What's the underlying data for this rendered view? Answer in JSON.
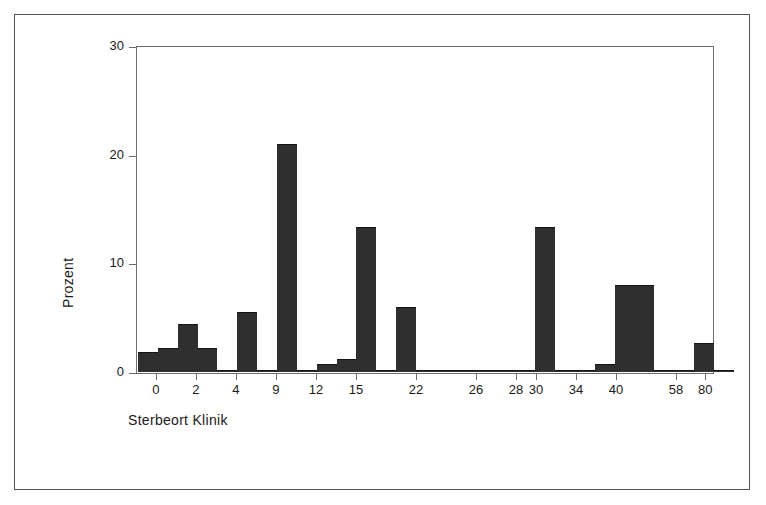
{
  "figure": {
    "background_color": "#ffffff",
    "frame_color": "#555555",
    "axis_color": "#6d6d6d",
    "bar_color": "#2f2f2f"
  },
  "chart_data": {
    "type": "bar",
    "title": "",
    "subtitle": "",
    "xlabel": "Sterbeort Klinik",
    "ylabel": "Prozent",
    "ylim": [
      0,
      30
    ],
    "ytick_labels": [
      "0",
      "10",
      "20",
      "30"
    ],
    "ytick_values": [
      0,
      10,
      20,
      30
    ],
    "grid": false,
    "legend": null,
    "xtick_labels": [
      "0",
      "2",
      "4",
      "9",
      "12",
      "15",
      "22",
      "26",
      "28",
      "30",
      "34",
      "40",
      "58",
      "80"
    ],
    "categories": [
      "0",
      "1",
      "2",
      "3",
      "4",
      "5",
      "9",
      "10",
      "11",
      "12",
      "13",
      "15",
      "16",
      "17",
      "22",
      "23",
      "26",
      "27",
      "28",
      "29",
      "30",
      "31",
      "34",
      "35",
      "40",
      "41",
      "42",
      "58",
      "59",
      "80"
    ],
    "values": [
      1.8,
      2.2,
      4.4,
      2.2,
      0.2,
      5.5,
      0.2,
      21.0,
      0.2,
      0.7,
      1.2,
      13.3,
      0.2,
      6.0,
      0.2,
      0.2,
      0.2,
      0.2,
      0.2,
      0.2,
      13.3,
      0.2,
      0.2,
      0.7,
      8.0,
      8.0,
      0.2,
      0.2,
      2.7,
      0.2
    ],
    "bars": [
      {
        "label": "0",
        "value": 1.8,
        "left_pct": 0.0,
        "width_pct": 3.46
      },
      {
        "label": "1",
        "value": 2.2,
        "left_pct": 3.46,
        "width_pct": 3.46
      },
      {
        "label": "2",
        "value": 4.4,
        "left_pct": 6.92,
        "width_pct": 3.46
      },
      {
        "label": "3",
        "value": 2.2,
        "left_pct": 10.38,
        "width_pct": 3.46
      },
      {
        "label": "4",
        "value": 0.2,
        "left_pct": 13.84,
        "width_pct": 3.46
      },
      {
        "label": "5",
        "value": 5.5,
        "left_pct": 17.3,
        "width_pct": 3.46
      },
      {
        "label": "9",
        "value": 0.2,
        "left_pct": 20.76,
        "width_pct": 3.46
      },
      {
        "label": "10",
        "value": 21.0,
        "left_pct": 24.22,
        "width_pct": 3.46
      },
      {
        "label": "11",
        "value": 0.2,
        "left_pct": 27.68,
        "width_pct": 3.46
      },
      {
        "label": "12",
        "value": 0.7,
        "left_pct": 31.14,
        "width_pct": 3.46
      },
      {
        "label": "13",
        "value": 1.2,
        "left_pct": 34.6,
        "width_pct": 3.46
      },
      {
        "label": "15",
        "value": 13.3,
        "left_pct": 38.06,
        "width_pct": 3.46
      },
      {
        "label": "16",
        "value": 0.2,
        "left_pct": 41.52,
        "width_pct": 3.46
      },
      {
        "label": "17",
        "value": 6.0,
        "left_pct": 44.98,
        "width_pct": 3.46
      },
      {
        "label": "22",
        "value": 0.2,
        "left_pct": 48.44,
        "width_pct": 3.46
      },
      {
        "label": "23",
        "value": 0.2,
        "left_pct": 51.9,
        "width_pct": 3.46
      },
      {
        "label": "26",
        "value": 0.2,
        "left_pct": 55.36,
        "width_pct": 3.46
      },
      {
        "label": "27",
        "value": 0.2,
        "left_pct": 58.82,
        "width_pct": 3.46
      },
      {
        "label": "28",
        "value": 0.2,
        "left_pct": 62.28,
        "width_pct": 3.46
      },
      {
        "label": "29",
        "value": 0.2,
        "left_pct": 65.74,
        "width_pct": 3.46
      },
      {
        "label": "30",
        "value": 13.3,
        "left_pct": 69.2,
        "width_pct": 3.46
      },
      {
        "label": "31",
        "value": 0.2,
        "left_pct": 72.66,
        "width_pct": 3.46
      },
      {
        "label": "34",
        "value": 0.2,
        "left_pct": 76.12,
        "width_pct": 3.46
      },
      {
        "label": "35",
        "value": 0.7,
        "left_pct": 79.58,
        "width_pct": 3.46
      },
      {
        "label": "40",
        "value": 8.0,
        "left_pct": 83.04,
        "width_pct": 3.46
      },
      {
        "label": "41",
        "value": 8.0,
        "left_pct": 86.5,
        "width_pct": 3.46
      },
      {
        "label": "42",
        "value": 0.2,
        "left_pct": 89.96,
        "width_pct": 3.46
      },
      {
        "label": "58",
        "value": 0.2,
        "left_pct": 93.42,
        "width_pct": 3.46
      },
      {
        "label": "59",
        "value": 2.7,
        "left_pct": 96.88,
        "width_pct": 3.46
      },
      {
        "label": "80",
        "value": 0.2,
        "left_pct": 100.34,
        "width_pct": 3.46
      }
    ],
    "xtick_positions_pct": [
      3.46,
      10.38,
      17.3,
      24.22,
      31.14,
      38.06,
      48.44,
      58.82,
      65.74,
      69.2,
      76.12,
      83.04,
      93.42,
      98.5
    ]
  }
}
